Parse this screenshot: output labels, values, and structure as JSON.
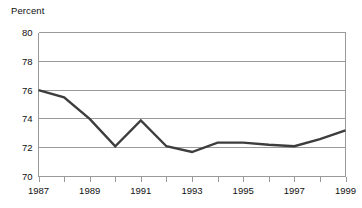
{
  "chart_data": {
    "type": "line",
    "title": "",
    "ylabel": "Percent",
    "xlabel": "",
    "ylim": [
      70,
      80
    ],
    "xlim": [
      1987,
      1999
    ],
    "grid": true,
    "legend": null,
    "ytick_labels": [
      "80",
      "78",
      "76",
      "74",
      "72",
      "70"
    ],
    "ytick_values": [
      80,
      78,
      76,
      74,
      72,
      70
    ],
    "xtick_values": [
      1987,
      1988,
      1989,
      1990,
      1991,
      1992,
      1993,
      1994,
      1995,
      1996,
      1997,
      1998,
      1999
    ],
    "xtick_labels": [
      "1987",
      "",
      "1989",
      "",
      "1991",
      "",
      "1993",
      "",
      "1995",
      "",
      "1997",
      "",
      "1999"
    ],
    "x": [
      1987,
      1988,
      1989,
      1990,
      1991,
      1992,
      1993,
      1994,
      1995,
      1996,
      1997,
      1998,
      1999
    ],
    "values": [
      76.0,
      75.5,
      74.0,
      72.1,
      73.9,
      72.1,
      71.7,
      72.35,
      72.35,
      72.2,
      72.1,
      72.6,
      73.2
    ],
    "series_name": "Percent",
    "line_color": "#3d3d3d",
    "grid_color": "#9a9a9a",
    "axis_color": "#808080",
    "background": "#ffffff"
  }
}
